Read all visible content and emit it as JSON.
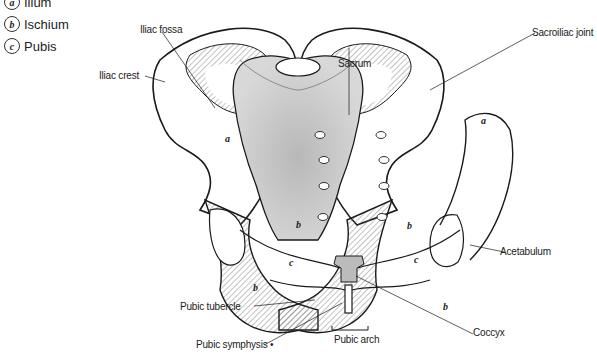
{
  "legend": {
    "items": [
      {
        "letter": "a",
        "label": "Ilium"
      },
      {
        "letter": "b",
        "label": "Ischium"
      },
      {
        "letter": "c",
        "label": "Pubis"
      }
    ]
  },
  "labels": {
    "iliac_fossa": "Iliac fossa",
    "iliac_crest": "Iliac crest",
    "sacrum": "Sacrum",
    "sacroiliac_joint": "Sacroiliac joint",
    "acetabulum": "Acetabulum",
    "pubic_tubercle": "Pubic tubercle",
    "pubic_symphysis": "Pubic symphysis •",
    "pubic_arch": "Pubic arch",
    "coccyx": "Coccyx"
  },
  "region_letters": {
    "left_a": "a",
    "right_a": "a",
    "left_b_upper": "b",
    "right_b_upper": "b",
    "left_c": "c",
    "right_c": "c",
    "left_b_lower": "b",
    "right_b_lower": "b"
  },
  "colors": {
    "line": "#1a1a1a",
    "sacrum_shade": "#c8c8c8",
    "hatch": "#555555"
  }
}
